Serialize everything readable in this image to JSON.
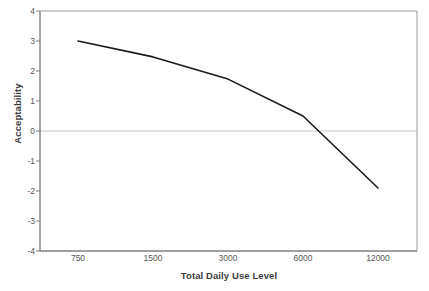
{
  "chart_data": {
    "type": "line",
    "title": "",
    "xlabel": "Total Daily Use Level",
    "ylabel": "Acceptability",
    "categories": [
      "750",
      "1500",
      "3000",
      "6000",
      "12000"
    ],
    "values": [
      3.0,
      2.47,
      1.73,
      0.5,
      -1.9
    ],
    "series": [
      {
        "name": "Acceptability",
        "values": [
          3.0,
          2.47,
          1.73,
          0.5,
          -1.9
        ],
        "color": "#1a1a1a"
      }
    ],
    "ylim": [
      -4,
      4
    ],
    "y_ticks": [
      "4",
      "3",
      "2",
      "1",
      "0",
      "-1",
      "-2",
      "-3",
      "-4"
    ],
    "y_tick_values": [
      4,
      3,
      2,
      1,
      0,
      -1,
      -2,
      -3,
      -4
    ],
    "x_ticks": [
      "750",
      "1500",
      "3000",
      "6000",
      "12000"
    ],
    "grid": "zero-line-only",
    "legend": "none",
    "zero_line_value": 0,
    "colors": {
      "line": "#1a1a1a",
      "axis": "#808080",
      "gridline": "#c8c8c8",
      "text": "#565656",
      "title_text": "#3c3c3c",
      "background": "#ffffff"
    }
  }
}
